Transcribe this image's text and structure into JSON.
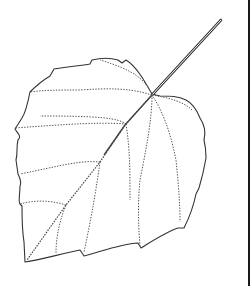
{
  "figure": {
    "colors": {
      "outline": "#333333",
      "veins": "#555555",
      "background": "#ffffff",
      "edge_line": "#1a1a1a"
    }
  }
}
